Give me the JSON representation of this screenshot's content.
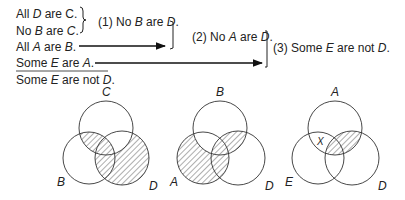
{
  "premises": [
    {
      "text_parts": [
        "All ",
        "D",
        " are C."
      ],
      "italic": [
        false,
        true,
        false
      ]
    },
    {
      "text_parts": [
        "No ",
        "B",
        " are ",
        "C",
        "."
      ],
      "italic": [
        false,
        true,
        false,
        true,
        false
      ]
    },
    {
      "text_parts": [
        "All ",
        "A",
        " are ",
        "B",
        "."
      ],
      "italic": [
        false,
        true,
        false,
        true,
        false
      ]
    },
    {
      "text_parts": [
        "Some ",
        "E",
        " are ",
        "A",
        "."
      ],
      "italic": [
        false,
        true,
        false,
        true,
        false
      ]
    }
  ],
  "conclusion": {
    "text_parts": [
      "Some ",
      "E",
      " are not ",
      "D",
      "."
    ],
    "italic": [
      false,
      true,
      false,
      true,
      false
    ]
  },
  "steps": [
    {
      "text_parts": [
        "(1) No ",
        "B",
        " are ",
        "D",
        "."
      ]
    },
    {
      "text_parts": [
        "(2) No ",
        "A",
        " are ",
        "D",
        "."
      ]
    },
    {
      "text_parts": [
        "(3) Some ",
        "E",
        " are not ",
        "D",
        "."
      ]
    }
  ],
  "venn_diagrams": [
    {
      "labels": {
        "top": "C",
        "left": "B",
        "right": "D"
      },
      "shaded": [
        "B∩C",
        "D outside C"
      ],
      "x_mark": null
    },
    {
      "labels": {
        "top": "B",
        "left": "A",
        "right": "D"
      },
      "shaded": [
        "A outside B",
        "B∩D"
      ],
      "x_mark": null
    },
    {
      "labels": {
        "top": "A",
        "left": "E",
        "right": "D"
      },
      "shaded": [
        "A∩D"
      ],
      "x_mark": {
        "label": "X",
        "region": "A∩E not D"
      }
    }
  ]
}
